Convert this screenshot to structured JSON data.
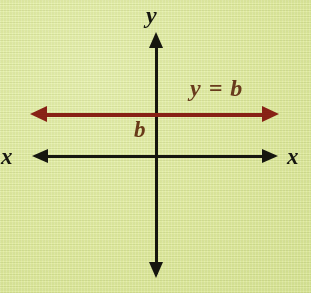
{
  "figure": {
    "background_color": "#dfeb9f",
    "axis_color": "#16160f",
    "line_color": "#8a2216",
    "label_color": "#6a3b1c"
  },
  "axes": {
    "vertical_label_top": "y",
    "horizontal_label_left": "x",
    "horizontal_label_right": "x"
  },
  "annotations": {
    "intercept_label": "b",
    "equation_label": "y = b"
  },
  "chart_data": {
    "type": "line",
    "title": "y = b",
    "xlabel": "x",
    "ylabel": "y",
    "series": [
      {
        "name": "y = b",
        "equation": "y = b",
        "color": "#8a2216",
        "kind": "horizontal-line",
        "y_intercept_label": "b",
        "points": [
          {
            "x": -1,
            "y": "b"
          },
          {
            "x": 1,
            "y": "b"
          }
        ],
        "extends_both_directions": true
      }
    ],
    "axis_arrows": [
      "up",
      "down",
      "left",
      "right"
    ],
    "grid": false,
    "legend": false,
    "annotations": [
      "y = b",
      "b"
    ]
  }
}
